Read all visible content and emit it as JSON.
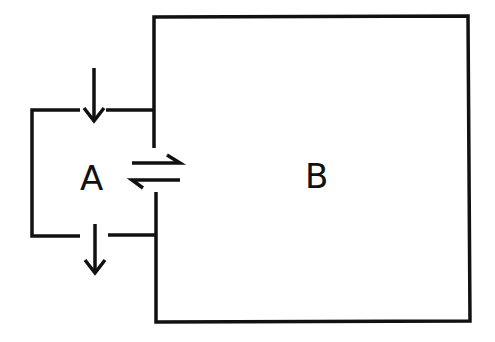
{
  "diagram": {
    "compartment_a": {
      "label": "A"
    },
    "compartment_b": {
      "label": "B"
    },
    "arrows": [
      {
        "name": "inflow",
        "direction": "down",
        "into": "A"
      },
      {
        "name": "outflow",
        "direction": "down",
        "out_of": "A"
      },
      {
        "name": "exchange",
        "type": "equilibrium",
        "between": [
          "A",
          "B"
        ]
      }
    ],
    "colors": {
      "line": "#111111",
      "background": "#ffffff"
    }
  }
}
